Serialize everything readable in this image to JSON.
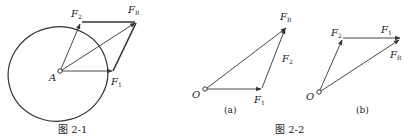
{
  "figure_2_1": {
    "caption": "图 2-1",
    "point_label": "A",
    "vectors": {
      "F1": {
        "label": "F",
        "sub": "1"
      },
      "F2": {
        "label": "F",
        "sub": "2"
      },
      "FR": {
        "label": "F",
        "sub": "R"
      }
    },
    "description": "Parallelogram rule: F1 and F2 from point A inside an ellipse, resultant FR as diagonal"
  },
  "figure_2_2": {
    "caption": "图 2-2",
    "panel_a": {
      "label": "(a)",
      "origin_label": "O",
      "F1": {
        "label": "F",
        "sub": "1"
      },
      "F2": {
        "label": "F",
        "sub": "2"
      },
      "FR": {
        "label": "F",
        "sub": "R"
      }
    },
    "panel_b": {
      "label": "(b)",
      "origin_label": "O",
      "F1": {
        "label": "F",
        "sub": "1"
      },
      "F2": {
        "label": "F",
        "sub": "2"
      },
      "FR": {
        "label": "F",
        "sub": "R"
      }
    },
    "description": "Force triangle rule: head-to-tail addition in two orders giving the same resultant FR"
  },
  "colors": {
    "stroke": "#333333",
    "background": "#ffffff"
  }
}
